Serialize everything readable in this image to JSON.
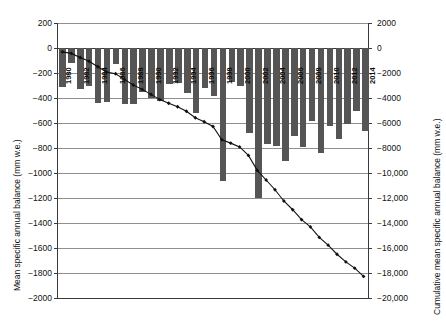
{
  "chart_data": {
    "type": "bar",
    "title": "",
    "subtitle": "",
    "xlabel": "",
    "ylabel": "Mean specific annual balance (mm w.e.)",
    "y2label": "Cumulative mean specific annual balance (mm w.e.)",
    "ylim": [
      -2000,
      200
    ],
    "y2lim": [
      -20000,
      2000
    ],
    "ytick_labels": [
      "200",
      "0",
      "-200",
      "-400",
      "-600",
      "-800",
      "-1000",
      "-1200",
      "-1400",
      "-1600",
      "-1800",
      "-2000"
    ],
    "ytick_values": [
      200,
      0,
      -200,
      -400,
      -600,
      -800,
      -1000,
      -1200,
      -1400,
      -1600,
      -1800,
      -2000
    ],
    "y2tick_labels": [
      "2000",
      "0",
      "-2000",
      "-4000",
      "-6000",
      "-8000",
      "-10,000",
      "-12,000",
      "-14,000",
      "-16,000",
      "-18,000",
      "-20,000"
    ],
    "y2tick_values": [
      2000,
      0,
      -2000,
      -4000,
      -6000,
      -8000,
      -10000,
      -12000,
      -14000,
      -16000,
      -18000,
      -20000
    ],
    "grid": true,
    "legend": "none",
    "bar_color": "#555555",
    "line_color": "#111111",
    "marker": "diamond",
    "categories": [
      "1980",
      "1981",
      "1982",
      "1983",
      "1984",
      "1985",
      "1986",
      "1987",
      "1988",
      "1989",
      "1990",
      "1991",
      "1992",
      "1993",
      "1994",
      "1995",
      "1996",
      "1997",
      "1998",
      "1999",
      "2000",
      "2001",
      "2002",
      "2003",
      "2004",
      "2005",
      "2006",
      "2007",
      "2008",
      "2009",
      "2010",
      "2011",
      "2012",
      "2013",
      "2014"
    ],
    "xtick_labels": [
      "1980",
      "1982",
      "1984",
      "1986",
      "1988",
      "1990",
      "1992",
      "1994",
      "1996",
      "1998",
      "2000",
      "2002",
      "2004",
      "2006",
      "2008",
      "2010",
      "2012",
      "2014"
    ],
    "series": [
      {
        "name": "Mean specific annual balance",
        "type": "bar",
        "axis": "left",
        "unit": "mm w.e.",
        "values": [
          -310,
          -120,
          -330,
          -300,
          -440,
          -430,
          -130,
          -450,
          -450,
          -350,
          -400,
          -420,
          -290,
          -280,
          -360,
          -520,
          -320,
          -380,
          -1060,
          -270,
          -300,
          -680,
          -1200,
          -770,
          -780,
          -900,
          -700,
          -790,
          -580,
          -840,
          -620,
          -730,
          -610,
          -500,
          -660
        ]
      },
      {
        "name": "Cumulative mean specific annual balance",
        "type": "line",
        "axis": "right",
        "unit": "mm w.e.",
        "values": [
          -310,
          -430,
          -760,
          -1060,
          -1500,
          -1930,
          -2060,
          -2510,
          -2960,
          -3310,
          -3710,
          -4130,
          -4420,
          -4700,
          -5060,
          -5580,
          -5900,
          -6280,
          -7340,
          -7610,
          -7910,
          -8590,
          -9790,
          -10560,
          -11340,
          -12240,
          -12940,
          -13730,
          -14310,
          -15150,
          -15770,
          -16500,
          -17110,
          -17610,
          -18270
        ]
      }
    ]
  }
}
